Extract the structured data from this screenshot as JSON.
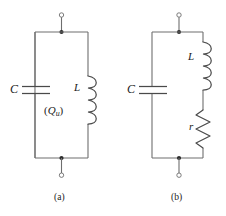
{
  "figure": {
    "background_color": "#ffffff",
    "line_color": "#6e6e6e",
    "text_color": "#1a1a1a",
    "panels": [
      {
        "id": "a",
        "caption": "(a)",
        "components": [
          {
            "name": "capacitor",
            "label": "C",
            "position": "left-rail"
          },
          {
            "name": "inductor",
            "label": "L",
            "position": "right-rail"
          }
        ],
        "annotation_open": "(",
        "annotation_symbol": "Q",
        "annotation_subscript": "u",
        "annotation_close": ")",
        "terminals": [
          "top",
          "bottom"
        ]
      },
      {
        "id": "b",
        "caption": "(b)",
        "components": [
          {
            "name": "capacitor",
            "label": "C",
            "position": "left-rail"
          },
          {
            "name": "inductor",
            "label": "L",
            "position": "right-rail-upper"
          },
          {
            "name": "resistor",
            "label": "r",
            "position": "right-rail-lower"
          }
        ],
        "terminals": [
          "top",
          "bottom"
        ]
      }
    ]
  }
}
